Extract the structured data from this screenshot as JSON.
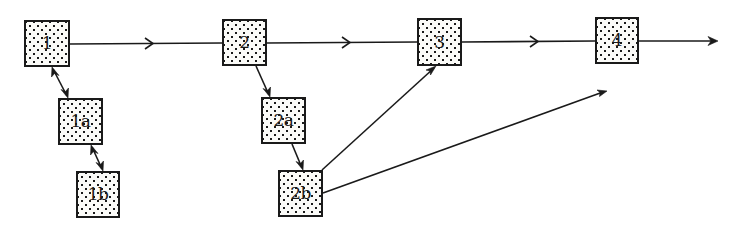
{
  "diagram": {
    "type": "flow",
    "background": "#ffffff",
    "stroke_color": "#1a1a1a",
    "nodes": [
      {
        "id": "1",
        "label": "1",
        "x": 24,
        "y": 20,
        "w": 46,
        "h": 47
      },
      {
        "id": "1a",
        "label": "1a",
        "x": 58,
        "y": 98,
        "w": 45,
        "h": 47
      },
      {
        "id": "1b",
        "label": "1b",
        "x": 76,
        "y": 171,
        "w": 44,
        "h": 47
      },
      {
        "id": "2",
        "label": "2",
        "x": 222,
        "y": 19,
        "w": 45,
        "h": 47
      },
      {
        "id": "2a",
        "label": "2a",
        "x": 261,
        "y": 97,
        "w": 45,
        "h": 47
      },
      {
        "id": "2b",
        "label": "2b",
        "x": 278,
        "y": 170,
        "w": 45,
        "h": 47
      },
      {
        "id": "3",
        "label": "3",
        "x": 417,
        "y": 18,
        "w": 45,
        "h": 48
      },
      {
        "id": "4",
        "label": "4",
        "x": 595,
        "y": 17,
        "w": 44,
        "h": 47
      }
    ],
    "edges": [
      {
        "from": "1",
        "to": "2",
        "style": "mid-chevron",
        "direction": "forward"
      },
      {
        "from": "2",
        "to": "3",
        "style": "mid-chevron",
        "direction": "forward"
      },
      {
        "from": "3",
        "to": "4",
        "style": "mid-chevron",
        "direction": "forward"
      },
      {
        "from": "4",
        "to": "(open end)",
        "style": "arrowhead",
        "direction": "forward"
      },
      {
        "from": "1",
        "to": "1a",
        "style": "arrowhead",
        "direction": "bidirectional"
      },
      {
        "from": "1a",
        "to": "1b",
        "style": "arrowhead",
        "direction": "bidirectional"
      },
      {
        "from": "2",
        "to": "2a",
        "style": "arrowhead",
        "direction": "forward"
      },
      {
        "from": "2a",
        "to": "2b",
        "style": "arrowhead",
        "direction": "forward"
      },
      {
        "from": "2b",
        "to": "3",
        "style": "arrowhead",
        "direction": "forward"
      },
      {
        "from": "2b",
        "to": "(open end below 4)",
        "style": "arrowhead",
        "direction": "forward"
      }
    ]
  }
}
